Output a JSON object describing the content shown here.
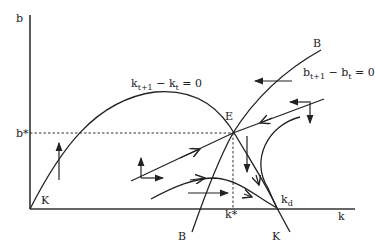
{
  "diagram": {
    "title": "",
    "axes": {
      "x_label": "k",
      "y_label": "b"
    },
    "reference_labels": {
      "b_star": "b*",
      "k_star": "k*",
      "k_d": "k",
      "k_d_sub": "d",
      "equilibrium": "E"
    },
    "curves": {
      "k_locus": {
        "label_main": "k",
        "label_sub1": "t+1",
        "label_mid": " − k",
        "label_sub2": "t",
        "label_end": " = 0",
        "end_label_origin": "K",
        "end_label_bottom": "K"
      },
      "b_locus": {
        "label_main": "b",
        "label_sub1": "t+1",
        "label_mid": " − b",
        "label_sub2": "t",
        "label_end": " = 0",
        "end_label_top": "B",
        "end_label_bottom": "B"
      }
    },
    "phase_arrows": [
      {
        "region": "left-of-k-locus",
        "direction": "up"
      },
      {
        "region": "below-both",
        "direction": "up-right"
      },
      {
        "region": "on-b-locus-top",
        "direction": "left"
      },
      {
        "region": "upper-right",
        "direction": "left-down"
      },
      {
        "region": "right-of-E",
        "direction": "down"
      },
      {
        "region": "bottom-middle",
        "direction": "right"
      }
    ],
    "trajectories": [
      {
        "name": "stable-arm-lower-left",
        "to": "E"
      },
      {
        "name": "stable-arm-upper-right",
        "to": "E"
      },
      {
        "name": "path-to-kd-hump",
        "to": "kd"
      },
      {
        "name": "path-to-kd-curved",
        "to": "kd"
      }
    ]
  }
}
